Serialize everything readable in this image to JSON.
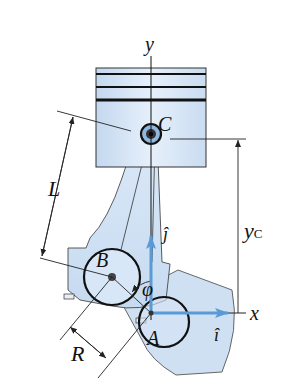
{
  "diagram": {
    "type": "mechanism",
    "labels": {
      "y_axis": "y",
      "x_axis": "x",
      "point_c": "C",
      "point_b": "B",
      "point_a": "A",
      "length_l": "L",
      "radius_r": "R",
      "angle_phi": "φ",
      "y_c_main": "y",
      "y_c_sub": "C",
      "unit_i": "î",
      "unit_j": "ĵ"
    },
    "colors": {
      "part_fill": "#cfe0f3",
      "part_fill_light": "#e3eefa",
      "outline": "#1a1a1a",
      "unit_vector": "#5b9bd5",
      "text": "#111111"
    }
  }
}
